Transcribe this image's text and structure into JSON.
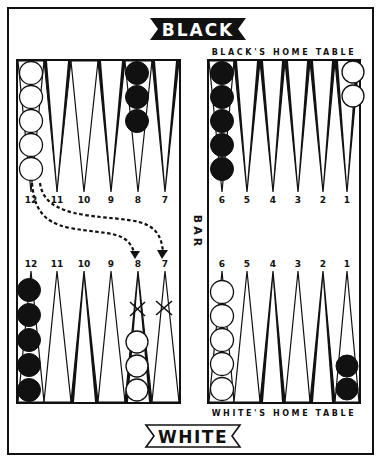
{
  "title_top": "BLACK",
  "title_bottom": "WHITE",
  "bar_label": "BAR",
  "black_home_label": "BLACK'S HOME TABLE",
  "white_home_label": "WHITE'S HOME TABLE",
  "colors": {
    "ink": "#111111",
    "paper": "#ffffff",
    "light_point": "#ffffff",
    "dark_point": "#111111"
  },
  "top_left": {
    "point_labels": [
      "12",
      "11",
      "10",
      "9",
      "8",
      "7"
    ],
    "checkers": [
      {
        "point": "12",
        "color": "white",
        "count": 5
      },
      {
        "point": "8",
        "color": "black",
        "count": 3
      }
    ]
  },
  "top_right": {
    "point_labels": [
      "6",
      "5",
      "4",
      "3",
      "2",
      "1"
    ],
    "checkers": [
      {
        "point": "6",
        "color": "black",
        "count": 5
      },
      {
        "point": "1",
        "color": "white",
        "count": 2
      }
    ]
  },
  "bottom_left": {
    "point_labels": [
      "12",
      "11",
      "10",
      "9",
      "8",
      "7"
    ],
    "checkers": [
      {
        "point": "12",
        "color": "black",
        "count": 5
      },
      {
        "point": "8",
        "color": "white",
        "count": 3
      }
    ],
    "x_marks": [
      "8",
      "7"
    ]
  },
  "bottom_right": {
    "point_labels": [
      "6",
      "5",
      "4",
      "3",
      "2",
      "1"
    ],
    "checkers": [
      {
        "point": "6",
        "color": "white",
        "count": 5
      },
      {
        "point": "1",
        "color": "black",
        "count": 2
      }
    ]
  },
  "moves": [
    {
      "from": "top 12",
      "to": "bottom 8",
      "style": "dashed-arrow"
    },
    {
      "from": "top 12",
      "to": "bottom 7",
      "style": "dashed-arrow"
    }
  ]
}
